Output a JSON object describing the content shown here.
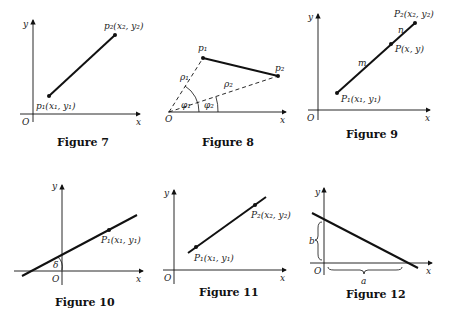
{
  "figures": [
    {
      "caption": "Figure 7",
      "axis_x": "x",
      "axis_y": "y",
      "origin": "O",
      "point1": "p₁(x₁, y₁)",
      "point2": "p₂(x₂, y₂)"
    },
    {
      "caption": "Figure 8",
      "axis_x": "x",
      "origin": "O",
      "point1": "p₁",
      "point2": "p₂",
      "rho1": "ρ₁",
      "rho2": "ρ₂",
      "phi1": "φ₁",
      "phi2": "φ₂"
    },
    {
      "caption": "Figure 9",
      "axis_x": "x",
      "axis_y": "y",
      "origin": "O",
      "point1": "P₁(x₁, y₁)",
      "point2": "P₂(x₂, y₂)",
      "point_mid": "P(x, y)",
      "seg_m": "m",
      "seg_n": "n"
    },
    {
      "caption": "Figure 10",
      "axis_x": "x",
      "axis_y": "y",
      "origin": "O",
      "point1": "P₁(x₁, y₁)",
      "angle": "δ"
    },
    {
      "caption": "Figure 11",
      "axis_x": "x",
      "axis_y": "y",
      "origin": "O",
      "point1": "P₁(x₁, y₁)",
      "point2": "P₂(x₂, y₂)"
    },
    {
      "caption": "Figure 12",
      "axis_x": "x",
      "axis_y": "y",
      "origin": "O",
      "intercept_b": "b",
      "intercept_a": "a"
    }
  ]
}
